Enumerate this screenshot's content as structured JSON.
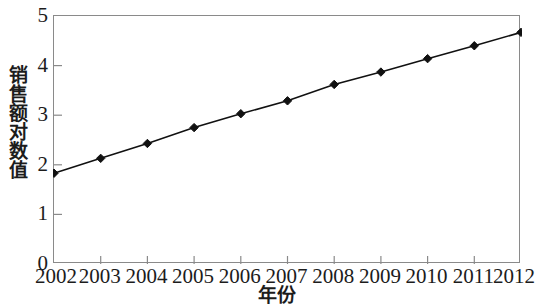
{
  "chart_data": {
    "type": "line",
    "title": "",
    "xlabel": "年份",
    "ylabel": "销售额对数值",
    "categories": [
      "2002",
      "2003",
      "2004",
      "2005",
      "2006",
      "2007",
      "2008",
      "2009",
      "2010",
      "2011",
      "2012"
    ],
    "x": [
      2002,
      2003,
      2004,
      2005,
      2006,
      2007,
      2008,
      2009,
      2010,
      2011,
      2012
    ],
    "values": [
      1.83,
      2.13,
      2.43,
      2.75,
      3.03,
      3.29,
      3.62,
      3.87,
      4.14,
      4.4,
      4.67
    ],
    "series": [
      {
        "name": "销售额对数值",
        "values": [
          1.83,
          2.13,
          2.43,
          2.75,
          3.03,
          3.29,
          3.62,
          3.87,
          4.14,
          4.4,
          4.67
        ],
        "marker": "diamond",
        "color": "#111111"
      }
    ],
    "ylim": [
      0,
      5
    ],
    "xlim": [
      2002,
      2012
    ],
    "yticks": [
      0,
      1,
      2,
      3,
      4,
      5
    ],
    "ytick_labels": [
      "0",
      "1",
      "2",
      "3",
      "4",
      "5"
    ],
    "xtick_labels": [
      "2002",
      "2003",
      "2004",
      "2005",
      "2006",
      "2007",
      "2008",
      "2009",
      "2010",
      "2011",
      "2012"
    ],
    "grid": false,
    "legend": null,
    "legend_position": "none",
    "line_color": "#111111",
    "axis_color": "#8a8a8a",
    "background": "#ffffff"
  }
}
